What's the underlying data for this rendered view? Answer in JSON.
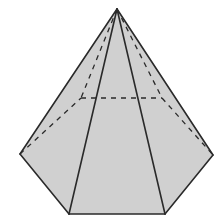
{
  "figure": {
    "colors": {
      "background": "#ffffff",
      "fill": "#d0d0d0",
      "edge": "#2a2a2a"
    },
    "vertices": {
      "apex": [
        117,
        9
      ],
      "front_left": [
        20,
        154
      ],
      "front_bottom_left": [
        69,
        214
      ],
      "front_bottom_right": [
        165,
        214
      ],
      "front_right": [
        213,
        155
      ],
      "back_left": [
        81,
        98
      ],
      "back_right": [
        162,
        98
      ]
    },
    "visible_edges": [
      [
        "apex",
        "front_left"
      ],
      [
        "apex",
        "front_bottom_left"
      ],
      [
        "apex",
        "front_bottom_right"
      ],
      [
        "apex",
        "front_right"
      ],
      [
        "front_left",
        "front_bottom_left"
      ],
      [
        "front_bottom_left",
        "front_bottom_right"
      ],
      [
        "front_bottom_right",
        "front_right"
      ]
    ],
    "hidden_edges": [
      [
        "apex",
        "back_left"
      ],
      [
        "apex",
        "back_right"
      ],
      [
        "front_left",
        "back_left"
      ],
      [
        "back_left",
        "back_right"
      ],
      [
        "back_right",
        "front_right"
      ]
    ]
  }
}
